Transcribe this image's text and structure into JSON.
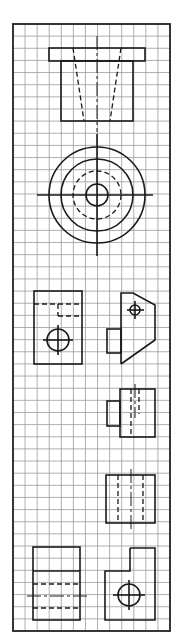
{
  "sheet": {
    "type": "orthographic-projection-exercise",
    "background": "#ffffff",
    "line_color": "#1a1a1a",
    "grid_color": "#9a9a9a",
    "border": {
      "x": 13,
      "y": 24,
      "width": 157,
      "height": 607
    },
    "grid": {
      "spacing": 12.08,
      "columns": 13,
      "rows": 50
    }
  },
  "views": [
    {
      "id": "flanged-bushing-front",
      "description": "Front view of flanged part with tapered hidden bore"
    },
    {
      "id": "flanged-bushing-top",
      "description": "Top view: concentric circles with dashed hidden circle and centerlines"
    },
    {
      "id": "block-front",
      "description": "Rectangular view with hidden notch and circular hole"
    },
    {
      "id": "block-side",
      "description": "Chamfered profile with small hole and boss"
    },
    {
      "id": "stepped-part-view",
      "description": "Rectangle with side boss and hidden bore"
    },
    {
      "id": "cylinder-side",
      "description": "Rectangle with two hidden lines and centerline"
    },
    {
      "id": "stepped-cylinder-front",
      "description": "Rectangle with step line and hidden lines"
    },
    {
      "id": "L-block-view",
      "description": "L-shaped outline with circle"
    }
  ]
}
